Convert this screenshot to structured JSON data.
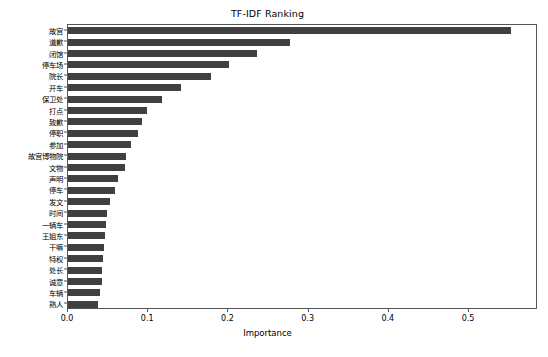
{
  "chart_data": {
    "type": "bar",
    "orientation": "horizontal",
    "title": "TF-IDF Ranking",
    "xlabel": "Importance",
    "ylabel": "",
    "xlim": [
      0.0,
      0.586
    ],
    "xticks": [
      0.0,
      0.1,
      0.2,
      0.3,
      0.4,
      0.5
    ],
    "xtick_labels": [
      "0.0",
      "0.1",
      "0.2",
      "0.3",
      "0.4",
      "0.5"
    ],
    "grid": false,
    "legend": false,
    "bar_color": "#404040",
    "categories": [
      "故宫",
      "道歉",
      "闭馆",
      "停车场",
      "院长",
      "开车",
      "保卫处",
      "打点",
      "致歉",
      "停职",
      "参加",
      "故宫博物院",
      "文物",
      "声明",
      "停车",
      "发文",
      "时间",
      "一辆车",
      "王姐东",
      "干嘛",
      "特权",
      "处长",
      "诚意",
      "车辆",
      "熟人"
    ],
    "values": [
      0.552,
      0.277,
      0.236,
      0.201,
      0.178,
      0.141,
      0.117,
      0.098,
      0.092,
      0.087,
      0.078,
      0.072,
      0.071,
      0.062,
      0.059,
      0.052,
      0.049,
      0.048,
      0.046,
      0.045,
      0.044,
      0.043,
      0.042,
      0.04,
      0.038
    ]
  }
}
